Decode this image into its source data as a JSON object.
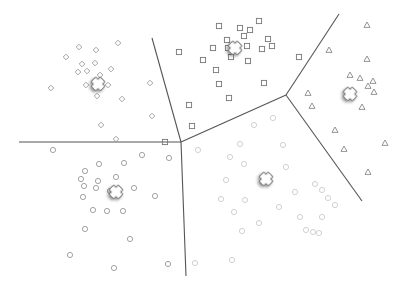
{
  "diagram": {
    "type": "k-means voronoi clustering",
    "width": 405,
    "height": 291,
    "line_color": "#555555",
    "boundaries": [
      {
        "x1": 19,
        "y1": 142,
        "x2": 181,
        "y2": 142
      },
      {
        "x1": 152,
        "y1": 38,
        "x2": 181,
        "y2": 142
      },
      {
        "x1": 181,
        "y1": 142,
        "x2": 186,
        "y2": 276
      },
      {
        "x1": 181,
        "y1": 142,
        "x2": 286,
        "y2": 95
      },
      {
        "x1": 286,
        "y1": 95,
        "x2": 339,
        "y2": 14
      },
      {
        "x1": 286,
        "y1": 95,
        "x2": 362,
        "y2": 201
      }
    ],
    "clusters": [
      {
        "name": "diamonds",
        "shape": "diamond",
        "color": "#999999",
        "centroid": {
          "x": 98,
          "y": 84
        },
        "points": [
          [
            79,
            47
          ],
          [
            96,
            50
          ],
          [
            118,
            43
          ],
          [
            66,
            57
          ],
          [
            82,
            64
          ],
          [
            95,
            63
          ],
          [
            111,
            69
          ],
          [
            78,
            72
          ],
          [
            87,
            71
          ],
          [
            100,
            75
          ],
          [
            51,
            88
          ],
          [
            86,
            85
          ],
          [
            108,
            85
          ],
          [
            97,
            96
          ],
          [
            122,
            99
          ],
          [
            150,
            83
          ],
          [
            152,
            116
          ],
          [
            101,
            125
          ],
          [
            116,
            139
          ]
        ]
      },
      {
        "name": "squares",
        "shape": "square",
        "color": "#777777",
        "centroid": {
          "x": 235,
          "y": 48
        },
        "points": [
          [
            219,
            26
          ],
          [
            240,
            28
          ],
          [
            259,
            21
          ],
          [
            250,
            30
          ],
          [
            244,
            36
          ],
          [
            227,
            40
          ],
          [
            228,
            48
          ],
          [
            262,
            49
          ],
          [
            213,
            48
          ],
          [
            247,
            46
          ],
          [
            231,
            57
          ],
          [
            203,
            60
          ],
          [
            248,
            61
          ],
          [
            179,
            52
          ],
          [
            299,
            57
          ],
          [
            216,
            70
          ],
          [
            219,
            84
          ],
          [
            264,
            83
          ],
          [
            229,
            98
          ],
          [
            189,
            105
          ],
          [
            192,
            126
          ],
          [
            165,
            142
          ],
          [
            268,
            39
          ],
          [
            272,
            46
          ]
        ]
      },
      {
        "name": "triangles",
        "shape": "triangle",
        "color": "#888888",
        "centroid": {
          "x": 350,
          "y": 94
        },
        "points": [
          [
            367,
            25
          ],
          [
            329,
            50
          ],
          [
            367,
            59
          ],
          [
            350,
            75
          ],
          [
            360,
            78
          ],
          [
            373,
            81
          ],
          [
            368,
            86
          ],
          [
            374,
            92
          ],
          [
            308,
            93
          ],
          [
            312,
            106
          ],
          [
            362,
            107
          ],
          [
            335,
            130
          ],
          [
            344,
            149
          ],
          [
            385,
            143
          ],
          [
            368,
            172
          ]
        ]
      },
      {
        "name": "circles-left",
        "shape": "circle",
        "color": "#999999",
        "centroid": {
          "x": 116,
          "y": 192
        },
        "points": [
          [
            53,
            150
          ],
          [
            142,
            155
          ],
          [
            99,
            164
          ],
          [
            124,
            163
          ],
          [
            169,
            158
          ],
          [
            85,
            171
          ],
          [
            81,
            179
          ],
          [
            98,
            181
          ],
          [
            116,
            177
          ],
          [
            84,
            186
          ],
          [
            96,
            188
          ],
          [
            110,
            191
          ],
          [
            134,
            188
          ],
          [
            83,
            197
          ],
          [
            155,
            196
          ],
          [
            93,
            210
          ],
          [
            107,
            211
          ],
          [
            123,
            211
          ],
          [
            85,
            229
          ],
          [
            130,
            239
          ],
          [
            70,
            255
          ],
          [
            114,
            268
          ],
          [
            168,
            264
          ]
        ]
      },
      {
        "name": "circles-right",
        "shape": "circle",
        "color": "#cccccc",
        "centroid": {
          "x": 266,
          "y": 179
        },
        "points": [
          [
            254,
            125
          ],
          [
            273,
            118
          ],
          [
            198,
            150
          ],
          [
            240,
            144
          ],
          [
            283,
            145
          ],
          [
            230,
            157
          ],
          [
            244,
            164
          ],
          [
            286,
            167
          ],
          [
            226,
            180
          ],
          [
            315,
            184
          ],
          [
            221,
            199
          ],
          [
            245,
            200
          ],
          [
            295,
            192
          ],
          [
            322,
            190
          ],
          [
            328,
            198
          ],
          [
            335,
            205
          ],
          [
            234,
            212
          ],
          [
            279,
            207
          ],
          [
            300,
            217
          ],
          [
            322,
            217
          ],
          [
            259,
            223
          ],
          [
            306,
            230
          ],
          [
            313,
            232
          ],
          [
            242,
            231
          ],
          [
            319,
            233
          ],
          [
            195,
            263
          ],
          [
            232,
            260
          ]
        ]
      }
    ]
  }
}
